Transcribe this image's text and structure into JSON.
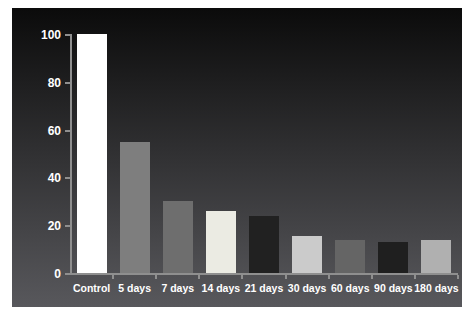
{
  "chart_data": {
    "type": "bar",
    "title": "",
    "xlabel": "",
    "ylabel": "",
    "categories": [
      "Control",
      "5 days",
      "7 days",
      "14 days",
      "21 days",
      "30 days",
      "60 days",
      "90 days",
      "180 days"
    ],
    "values": [
      100,
      55,
      30,
      26,
      24,
      15.5,
      14,
      13,
      14
    ],
    "bar_colors": [
      "#ffffff",
      "#7e7e7e",
      "#6e6e6e",
      "#ebebe3",
      "#212121",
      "#cbcbcb",
      "#656565",
      "#1f1f1f",
      "#b0b0b0"
    ],
    "ylim": [
      0,
      100
    ],
    "yticks": [
      0,
      20,
      40,
      60,
      80,
      100
    ],
    "grid": false,
    "legend": "none",
    "axis_color": "#8f8f8f",
    "tick_label_color": "#ffffff",
    "plot_background_top": "#0b0b0b",
    "plot_background_bottom": "#58585c",
    "frame_background": "#ffffff"
  }
}
